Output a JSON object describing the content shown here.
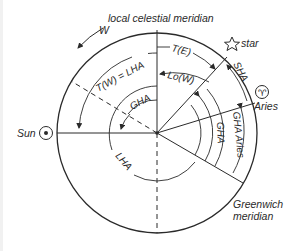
{
  "diagram": {
    "labels": {
      "local_celestial_meridian": "local celestial meridian",
      "west": "W",
      "t_west_eq_lha": "T(W) = LHA",
      "t_east": "T(E)",
      "lo_west": "Lo(W)",
      "gha_sun": "GHA",
      "lha_sun": "LHA",
      "star": "star",
      "sha": "SHA",
      "aries": "Aries",
      "gha_aries": "GHA Aries",
      "gha_star": "GHA",
      "sun": "Sun",
      "greenwich_1": "Greenwich",
      "greenwich_2": "meridian"
    },
    "symbols": {
      "star": "☆",
      "aries": "♈",
      "sun": "☉"
    },
    "colors": {
      "ink": "#2a2a2a",
      "background": "#ffffff"
    }
  }
}
